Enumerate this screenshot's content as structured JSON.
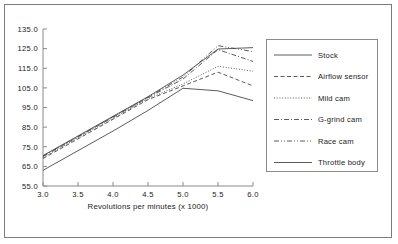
{
  "chart_data": {
    "type": "line",
    "title": "",
    "xlabel": "Revolutions per minutes (x 1000)",
    "ylabel": "",
    "x": [
      3.0,
      3.5,
      4.0,
      4.5,
      5.0,
      5.5,
      6.0
    ],
    "xtick_labels": [
      "3.0",
      "3.5",
      "4.0",
      "4.5",
      "5.0",
      "5.5",
      "6.0"
    ],
    "ytick_labels": [
      "55.0",
      "65.0",
      "75.0",
      "85.0",
      "95.0",
      "105.0",
      "115.0",
      "125.0",
      "135.0"
    ],
    "ytick_values": [
      55.0,
      65.0,
      75.0,
      85.0,
      95.0,
      105.0,
      115.0,
      125.0,
      135.0
    ],
    "xlim": [
      3.0,
      6.0
    ],
    "ylim": [
      55.0,
      135.0
    ],
    "grid": false,
    "legend_position": "right",
    "series": [
      {
        "name": "Stock",
        "dash": "solid",
        "values": [
          63.0,
          73.0,
          83.0,
          93.5,
          104.8,
          103.5,
          98.5
        ]
      },
      {
        "name": "Airflow sensor",
        "dash": "dashed",
        "values": [
          69.0,
          79.0,
          89.0,
          99.0,
          106.0,
          113.0,
          106.0
        ]
      },
      {
        "name": "Mild cam",
        "dash": "dotted",
        "values": [
          69.5,
          79.5,
          89.5,
          99.5,
          107.0,
          116.0,
          113.5
        ]
      },
      {
        "name": "G-grind cam",
        "dash": "dashdot",
        "values": [
          70.0,
          80.0,
          90.0,
          100.0,
          109.5,
          124.5,
          118.5
        ]
      },
      {
        "name": "Race cam",
        "dash": "dashdotdot",
        "values": [
          70.3,
          80.3,
          90.3,
          100.3,
          110.5,
          126.5,
          123.5
        ]
      },
      {
        "name": "Throttle body",
        "dash": "solid",
        "values": [
          70.5,
          80.5,
          90.5,
          100.5,
          111.5,
          124.8,
          125.5
        ]
      }
    ]
  },
  "colors": {
    "line": "#4a4a4a",
    "axis": "#8a8a8a",
    "text": "#1a1a1a",
    "border": "#7c7c7c",
    "background": "#ffffff"
  }
}
